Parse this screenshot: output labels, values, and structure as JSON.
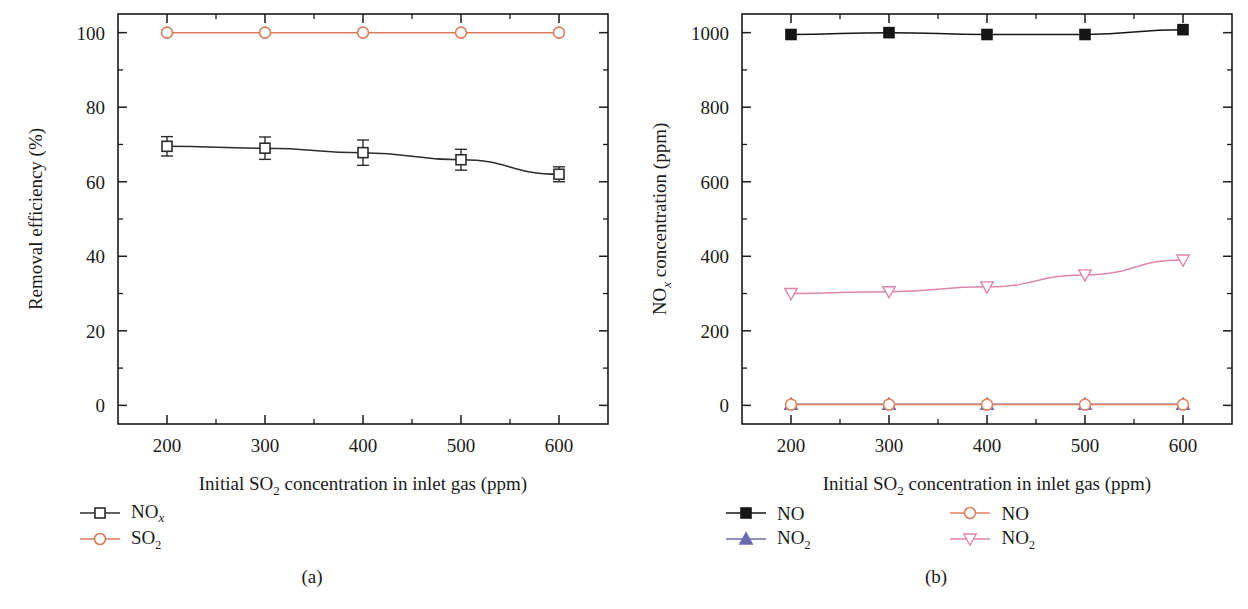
{
  "figure": {
    "panels": [
      {
        "caption": "(a)",
        "xlabel_parts": {
          "pre": "Initial SO",
          "sub": "2",
          "post": " concentration in inlet gas (ppm)"
        },
        "ylabel_parts": {
          "pre": "Removal efficiency (%)"
        },
        "legend": [
          {
            "label_pre": "NO",
            "label_sub_italic": "x",
            "label_sub": "",
            "marker": "open-square",
            "color": "#2b2b2b"
          },
          {
            "label_pre": "SO",
            "label_sub_italic": "",
            "label_sub": "2",
            "marker": "open-circle",
            "color": "#d97a5a"
          }
        ]
      },
      {
        "caption": "(b)",
        "xlabel_parts": {
          "pre": "Initial SO",
          "sub": "2",
          "post": " concentration in inlet gas (ppm)"
        },
        "ylabel_parts": {
          "pre": "NO",
          "sub_italic": "x",
          "post": " concentration (ppm)"
        },
        "legend": [
          {
            "label_pre": "NO",
            "label_sub_italic": "",
            "label_sub": "",
            "marker": "filled-square",
            "color": "#161616"
          },
          {
            "label_pre": "NO",
            "label_sub_italic": "",
            "label_sub": "2",
            "marker": "filled-triangle-up",
            "color": "#6b6bb0"
          },
          {
            "label_pre": "NO",
            "label_sub_italic": "",
            "label_sub": "",
            "marker": "open-circle",
            "color": "#e0815f"
          },
          {
            "label_pre": "NO",
            "label_sub_italic": "",
            "label_sub": "2",
            "marker": "open-triangle-down",
            "color": "#dd85ac"
          }
        ]
      }
    ]
  },
  "chart_data": [
    {
      "type": "line",
      "panel": "(a)",
      "title": "",
      "xlabel": "Initial SO2 concentration in inlet gas (ppm)",
      "ylabel": "Removal efficiency (%)",
      "x": [
        200,
        300,
        400,
        500,
        600
      ],
      "xlim": [
        150,
        650
      ],
      "ylim": [
        -5,
        105
      ],
      "xticks": [
        200,
        300,
        400,
        500,
        600
      ],
      "yticks": [
        0,
        20,
        40,
        60,
        80,
        100
      ],
      "xtick_labels": [
        "200",
        "300",
        "400",
        "500",
        "600"
      ],
      "ytick_labels": [
        "0",
        "20",
        "40",
        "60",
        "80",
        "100"
      ],
      "minor_ticks": true,
      "grid": false,
      "legend_position": "below-left",
      "series": [
        {
          "name": "NOx",
          "marker": "open-square",
          "color": "#2b2b2b",
          "values": [
            69.5,
            69.0,
            67.8,
            65.9,
            62.0
          ],
          "errors": [
            2.6,
            3.0,
            3.4,
            2.8,
            2.0
          ]
        },
        {
          "name": "SO2",
          "marker": "open-circle",
          "color": "#d97a5a",
          "values": [
            100,
            100,
            100,
            100,
            100
          ],
          "errors": [
            0,
            0,
            0,
            0,
            0
          ]
        }
      ]
    },
    {
      "type": "line",
      "panel": "(b)",
      "title": "",
      "xlabel": "Initial SO2 concentration in inlet gas (ppm)",
      "ylabel": "NOx concentration (ppm)",
      "x": [
        200,
        300,
        400,
        500,
        600
      ],
      "xlim": [
        150,
        650
      ],
      "ylim": [
        -50,
        1050
      ],
      "xticks": [
        200,
        300,
        400,
        500,
        600
      ],
      "yticks": [
        0,
        200,
        400,
        600,
        800,
        1000
      ],
      "xtick_labels": [
        "200",
        "300",
        "400",
        "500",
        "600"
      ],
      "ytick_labels": [
        "0",
        "200",
        "400",
        "600",
        "800",
        "1000"
      ],
      "minor_ticks": true,
      "grid": false,
      "legend_position": "below",
      "series": [
        {
          "name": "NO (inlet)",
          "marker": "filled-square",
          "color": "#161616",
          "values": [
            995,
            1000,
            995,
            995,
            1008
          ]
        },
        {
          "name": "NO2 (inlet)",
          "marker": "filled-triangle-up",
          "color": "#6b6bb0",
          "values": [
            3,
            3,
            3,
            3,
            3
          ]
        },
        {
          "name": "NO (outlet)",
          "marker": "open-circle",
          "color": "#e0815f",
          "values": [
            2,
            2,
            2,
            2,
            2
          ]
        },
        {
          "name": "NO2 (outlet)",
          "marker": "open-triangle-down",
          "color": "#dd85ac",
          "values": [
            300,
            305,
            318,
            350,
            390
          ]
        }
      ]
    }
  ]
}
